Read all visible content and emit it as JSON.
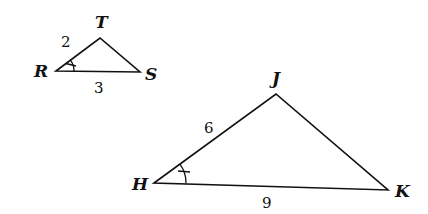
{
  "diagram": {
    "type": "similar-triangles",
    "stroke_color": "#111111",
    "background": "#ffffff",
    "triangles": [
      {
        "name": "RST",
        "vertices": [
          {
            "label": "R",
            "x": 56,
            "y": 71
          },
          {
            "label": "T",
            "x": 100,
            "y": 38
          },
          {
            "label": "S",
            "x": 140,
            "y": 72
          }
        ],
        "side_labels": [
          {
            "side": "RT",
            "label": "2"
          },
          {
            "side": "RS",
            "label": "3"
          }
        ],
        "marked_angle": "R"
      },
      {
        "name": "HJK",
        "vertices": [
          {
            "label": "H",
            "x": 154,
            "y": 183
          },
          {
            "label": "J",
            "x": 276,
            "y": 94
          },
          {
            "label": "K",
            "x": 388,
            "y": 190
          }
        ],
        "side_labels": [
          {
            "side": "HJ",
            "label": "6"
          },
          {
            "side": "HK",
            "label": "9"
          }
        ],
        "marked_angle": "H"
      }
    ]
  }
}
